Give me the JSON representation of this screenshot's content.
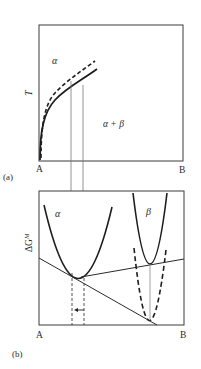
{
  "panel_a": {
    "tag": "(a)",
    "y_axis_label": "T",
    "x_left_label": "A",
    "x_right_label": "B",
    "region_top": "α",
    "region_bottom": "α + β",
    "curves": [
      {
        "name": "equilibrium boundary",
        "style": "solid"
      },
      {
        "name": "shifted boundary",
        "style": "dashed"
      }
    ]
  },
  "panel_b": {
    "tag": "(b)",
    "y_axis_label": "ΔG",
    "y_axis_superscript": "M",
    "x_left_label": "A",
    "x_right_label": "B",
    "phase_alpha_label": "α",
    "phase_beta_label": "β",
    "curves": [
      {
        "name": "alpha free energy",
        "style": "solid"
      },
      {
        "name": "beta free energy",
        "style": "solid"
      },
      {
        "name": "beta free energy shifted",
        "style": "dashed"
      },
      {
        "name": "common tangent",
        "style": "solid"
      },
      {
        "name": "shifted common tangent",
        "style": "solid"
      }
    ],
    "arrow_direction": "left"
  }
}
